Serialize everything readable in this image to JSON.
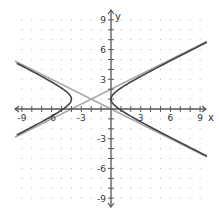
{
  "chart_data": {
    "type": "line",
    "title": "",
    "xlabel": "x",
    "ylabel": "y",
    "xlim": [
      -10,
      10
    ],
    "ylim": [
      -10,
      10
    ],
    "grid": "dots at every integer",
    "x_tick_labels": [
      "-9",
      "-6",
      "-3",
      "3",
      "6",
      "9"
    ],
    "y_tick_labels": [
      "9",
      "6",
      "3",
      "-3",
      "-6",
      "-9"
    ],
    "x_ticks": [
      -9,
      -6,
      -3,
      3,
      6,
      9
    ],
    "y_ticks": [
      9,
      6,
      3,
      -3,
      -6,
      -9
    ],
    "hyperbola": {
      "equation": "(x+2)^2/4 - (y-1)^2/1 = 1",
      "center": [
        -2,
        1
      ],
      "a": 2,
      "b": 1,
      "orientation": "horizontal",
      "vertices": [
        [
          -4,
          1
        ],
        [
          0,
          1
        ]
      ],
      "color": "#444444"
    },
    "asymptotes": [
      {
        "equation": "y - 1 = 0.5(x + 2)",
        "slope": 0.5,
        "through": [
          -2,
          1
        ],
        "color": "#aaaaaa"
      },
      {
        "equation": "y - 1 = -0.5(x + 2)",
        "slope": -0.5,
        "through": [
          -2,
          1
        ],
        "color": "#aaaaaa"
      }
    ],
    "series": [
      {
        "name": "hyperbola right branch",
        "points": [
          [
            0,
            1
          ],
          [
            1.2,
            3.2
          ],
          [
            3.1,
            4.5
          ],
          [
            6,
            5.6
          ],
          [
            9.7,
            6.7
          ]
        ]
      },
      {
        "name": "hyperbola left branch",
        "points": [
          [
            -4,
            1
          ],
          [
            -5.2,
            3.2
          ],
          [
            -7.1,
            4.5
          ],
          [
            -9.7,
            4.75
          ]
        ]
      },
      {
        "name": "asymptote 1",
        "points": [
          [
            -9.7,
            -2.85
          ],
          [
            9.7,
            6.85
          ]
        ]
      },
      {
        "name": "asymptote 2",
        "points": [
          [
            -9.7,
            4.85
          ],
          [
            9.7,
            -4.85
          ]
        ]
      }
    ]
  }
}
